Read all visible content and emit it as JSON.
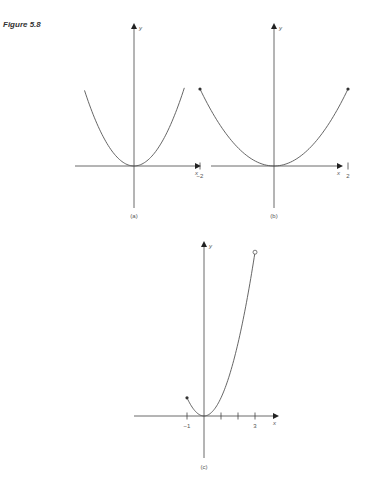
{
  "figure_label": "Figure 5.8",
  "chart_data": [
    {
      "type": "line",
      "panel": "(a)",
      "function": "y = x^2",
      "domain": "all real x",
      "xlabel": "x",
      "ylabel": "y",
      "x_ticks": [],
      "endpoints": []
    },
    {
      "type": "line",
      "panel": "(b)",
      "function": "y = x^2",
      "domain": [
        -2,
        2
      ],
      "xlabel": "x",
      "ylabel": "y",
      "x_ticks": [
        {
          "value": -2,
          "label": "−2"
        },
        {
          "value": 2,
          "label": "2"
        }
      ],
      "endpoints": [
        {
          "x": -2,
          "y": 4,
          "style": "closed"
        },
        {
          "x": 2,
          "y": 4,
          "style": "closed"
        }
      ]
    },
    {
      "type": "line",
      "panel": "(c)",
      "function": "y = x^2",
      "domain": [
        -1,
        3
      ],
      "xlabel": "x",
      "ylabel": "y",
      "x_ticks": [
        {
          "value": -1,
          "label": "−1"
        },
        {
          "value": 1,
          "label": ""
        },
        {
          "value": 2,
          "label": ""
        },
        {
          "value": 3,
          "label": "3"
        }
      ],
      "endpoints": [
        {
          "x": -1,
          "y": 1,
          "style": "closed"
        },
        {
          "x": 3,
          "y": 9,
          "style": "open"
        }
      ]
    }
  ]
}
